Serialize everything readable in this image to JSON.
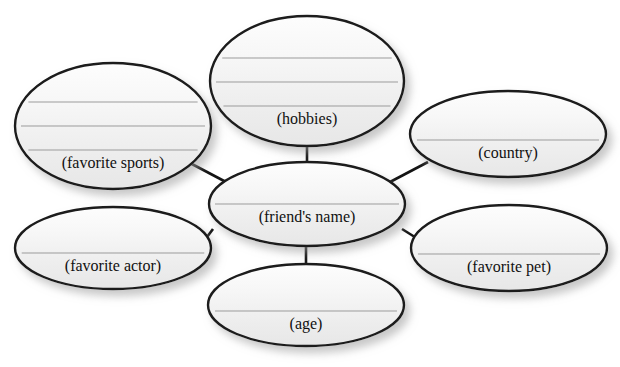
{
  "diagram": {
    "type": "concept-map",
    "title_fragment_top_left": "p",
    "title_fragment_top_right": "y",
    "canvas": {
      "width": 620,
      "height": 367,
      "background": "#ffffff"
    },
    "style": {
      "ellipse_fill_light": "#fbfbfb",
      "ellipse_fill_dark": "#ececec",
      "ellipse_stroke": "#1a1a1a",
      "ellipse_stroke_width": 2.4,
      "rule_line_color": "#9b9b9b",
      "rule_line_width": 1,
      "connector_color": "#141414",
      "connector_width": 2.6,
      "shadow_color": "#b5b5b5",
      "label_color": "#111111"
    },
    "center_node": {
      "id": "friends-name",
      "label": "(friend's name)",
      "cx": 307,
      "cy": 204,
      "rx": 98,
      "ry": 42,
      "font_size": 16,
      "label_dy": 14,
      "rule_lines": 1
    },
    "nodes": [
      {
        "id": "hobbies",
        "label": "(hobbies)",
        "cx": 307,
        "cy": 81,
        "rx": 97,
        "ry": 65,
        "font_size": 16,
        "label_dy": 39,
        "rule_lines": 3
      },
      {
        "id": "favorite-sports",
        "label": "(favorite sports)",
        "cx": 113,
        "cy": 126,
        "rx": 98,
        "ry": 63,
        "font_size": 16,
        "label_dy": 38,
        "rule_lines": 3
      },
      {
        "id": "country",
        "label": "(country)",
        "cx": 508,
        "cy": 134,
        "rx": 98,
        "ry": 43,
        "font_size": 16,
        "label_dy": 20,
        "rule_lines": 1
      },
      {
        "id": "favorite-actor",
        "label": "(favorite actor)",
        "cx": 113,
        "cy": 248,
        "rx": 98,
        "ry": 41,
        "font_size": 16,
        "label_dy": 19,
        "rule_lines": 1
      },
      {
        "id": "favorite-pet",
        "label": "(favorite pet)",
        "cx": 509,
        "cy": 248,
        "rx": 98,
        "ry": 43,
        "font_size": 16,
        "label_dy": 20,
        "rule_lines": 1
      },
      {
        "id": "age",
        "label": "(age)",
        "cx": 306,
        "cy": 305,
        "rx": 98,
        "ry": 41,
        "font_size": 16,
        "label_dy": 20,
        "rule_lines": 1
      }
    ],
    "connectors": [
      {
        "id": "center-to-hobbies",
        "from": "friends-name",
        "to": "hobbies",
        "x1": 307,
        "y1": 162,
        "x2": 307,
        "y2": 145
      },
      {
        "id": "center-to-favorite-sports",
        "from": "friends-name",
        "to": "favorite-sports",
        "x1": 226,
        "y1": 182,
        "x2": 190,
        "y2": 163
      },
      {
        "id": "center-to-country",
        "from": "friends-name",
        "to": "country",
        "x1": 390,
        "y1": 182,
        "x2": 428,
        "y2": 162
      },
      {
        "id": "center-to-favorite-actor",
        "from": "friends-name",
        "to": "favorite-actor",
        "x1": 213,
        "y1": 229,
        "x2": 207,
        "y2": 237
      },
      {
        "id": "center-to-favorite-pet",
        "from": "friends-name",
        "to": "favorite-pet",
        "x1": 402,
        "y1": 229,
        "x2": 418,
        "y2": 239
      },
      {
        "id": "center-to-age",
        "from": "friends-name",
        "to": "age",
        "x1": 306,
        "y1": 246,
        "x2": 306,
        "y2": 265
      }
    ]
  }
}
